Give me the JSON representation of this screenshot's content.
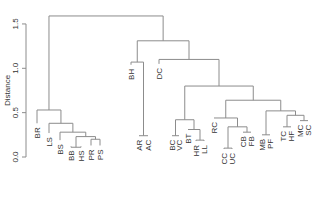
{
  "chart_data": {
    "type": "dendrogram",
    "title": "",
    "xlabel": "",
    "ylabel": "Distance",
    "ylim": [
      0,
      1.6
    ],
    "yticks": [
      0.0,
      0.5,
      1.0,
      1.5
    ],
    "ytick_labels": [
      "0.0",
      "0.5",
      "1.0",
      "1.5"
    ],
    "grid": false,
    "line_color": "#8c8c8c",
    "leaves": [
      "BR",
      "LS",
      "BS",
      "BB",
      "HS",
      "PR",
      "PS",
      "BH",
      "AR",
      "AC",
      "DC",
      "BC",
      "VC",
      "BT",
      "HR",
      "LL",
      "RC",
      "CC",
      "UC",
      "CB",
      "FB",
      "MB",
      "PF",
      "TC",
      "HF",
      "MC",
      "SC"
    ],
    "leaf_x": {
      "BR": 37,
      "LS": 49,
      "BS": 60,
      "BB": 71,
      "HS": 81,
      "PR": 91,
      "PS": 100,
      "BH": 131,
      "AR": 139,
      "AC": 148,
      "DC": 159,
      "BC": 172,
      "VC": 179,
      "BT": 188,
      "HR": 196,
      "LL": 204,
      "RC": 214,
      "CC": 224,
      "UC": 232,
      "CB": 243,
      "FB": 251,
      "MB": 262,
      "PF": 270,
      "TC": 283,
      "HF": 291,
      "MC": 300,
      "SC": 308
    },
    "leaf_tip_height": {
      "BR": 0.38,
      "LS": 0.27,
      "BS": 0.19,
      "BB": 0.12,
      "HS": 0.12,
      "PR": 0.13,
      "PS": 0.13,
      "BH": 1.04,
      "AR": 0.24,
      "AC": 0.24,
      "DC": 1.05,
      "BC": 0.24,
      "VC": 0.24,
      "BT": 0.31,
      "HR": 0.18,
      "LL": 0.18,
      "RC": 0.44,
      "CC": 0.09,
      "UC": 0.09,
      "CB": 0.28,
      "FB": 0.28,
      "MB": 0.25,
      "PF": 0.25,
      "TC": 0.34,
      "HF": 0.34,
      "MC": 0.41,
      "SC": 0.41
    },
    "merges": [
      {
        "id": "m_bb_hs",
        "left": "BB",
        "right": "HS",
        "height": 0.11
      },
      {
        "id": "m_pr_ps",
        "left": "PR",
        "right": "PS",
        "height": 0.2
      },
      {
        "id": "m_bbhs_prps",
        "left": "m_bb_hs",
        "right": "m_pr_ps",
        "height": 0.23
      },
      {
        "id": "m_bs",
        "left": "BS",
        "right": "m_bbhs_prps",
        "height": 0.28
      },
      {
        "id": "m_ls",
        "left": "LS",
        "right": "m_bs",
        "height": 0.38
      },
      {
        "id": "m_br",
        "left": "BR",
        "right": "m_ls",
        "height": 0.53
      },
      {
        "id": "m_ar_ac",
        "left": "AR",
        "right": "AC",
        "height": 0.24
      },
      {
        "id": "m_bh",
        "left": "BH",
        "right": "m_ar_ac",
        "height": 1.07
      },
      {
        "id": "m_bc_vc",
        "left": "BC",
        "right": "VC",
        "height": 0.24
      },
      {
        "id": "m_hr_ll",
        "left": "HR",
        "right": "LL",
        "height": 0.19
      },
      {
        "id": "m_bt",
        "left": "BT",
        "right": "m_hr_ll",
        "height": 0.31
      },
      {
        "id": "m_bcvc_bt",
        "left": "m_bc_vc",
        "right": "m_bt",
        "height": 0.42
      },
      {
        "id": "m_cc_uc",
        "left": "CC",
        "right": "UC",
        "height": 0.1
      },
      {
        "id": "m_cb_fb",
        "left": "CB",
        "right": "FB",
        "height": 0.28
      },
      {
        "id": "m_ccuc_cbfb",
        "left": "m_cc_uc",
        "right": "m_cb_fb",
        "height": 0.34
      },
      {
        "id": "m_rc",
        "left": "RC",
        "right": "m_ccuc_cbfb",
        "height": 0.44
      },
      {
        "id": "m_mb_pf",
        "left": "MB",
        "right": "PF",
        "height": 0.25
      },
      {
        "id": "m_tc_hf",
        "left": "TC",
        "right": "HF",
        "height": 0.34
      },
      {
        "id": "m_mc_sc",
        "left": "MC",
        "right": "SC",
        "height": 0.41
      },
      {
        "id": "m_tchf_mcsc",
        "left": "m_tc_hf",
        "right": "m_mc_sc",
        "height": 0.47
      },
      {
        "id": "m_mbpf_rest",
        "left": "m_mb_pf",
        "right": "m_tchf_mcsc",
        "height": 0.52
      },
      {
        "id": "m_rc_mb",
        "left": "m_rc",
        "right": "m_mbpf_rest",
        "height": 0.64
      },
      {
        "id": "m_bc_rc",
        "left": "m_bcvc_bt",
        "right": "m_rc_mb",
        "height": 0.8
      },
      {
        "id": "m_dc",
        "left": "DC",
        "right": "m_bc_rc",
        "height": 1.1
      },
      {
        "id": "m_bh_dc",
        "left": "m_bh",
        "right": "m_dc",
        "height": 1.31
      },
      {
        "id": "m_root",
        "left": "m_br",
        "right": "m_bh_dc",
        "height": 1.59
      }
    ]
  },
  "layout": {
    "y_axis_x": 26,
    "y_zero_px": 157,
    "px_per_unit": 88.7,
    "label_gap": 4
  }
}
